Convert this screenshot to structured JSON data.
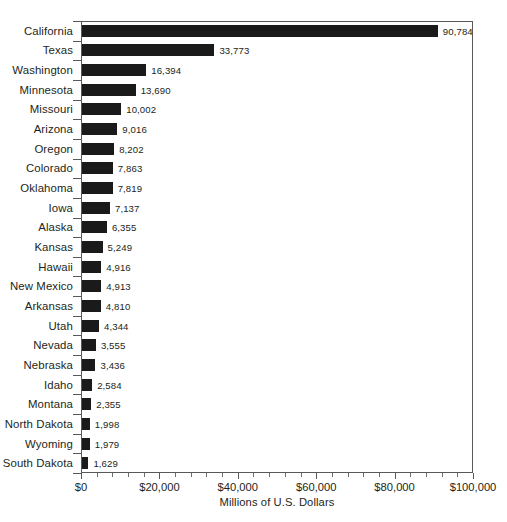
{
  "chart_data": {
    "type": "bar",
    "orientation": "horizontal",
    "title": "",
    "xlabel": "Millions of U.S. Dollars",
    "ylabel": "",
    "xlim": [
      0,
      100000
    ],
    "grid": false,
    "legend": null,
    "xtick_labels": [
      "$0",
      "$20,000",
      "$40,000",
      "$60,000",
      "$80,000",
      "$100,000"
    ],
    "xtick_values": [
      0,
      20000,
      40000,
      60000,
      80000,
      100000
    ],
    "minor_tick_step": 4000,
    "bar_color": "#1a1a1a",
    "axis_color": "#58595b",
    "categories": [
      "California",
      "Texas",
      "Washington",
      "Minnesota",
      "Missouri",
      "Arizona",
      "Oregon",
      "Colorado",
      "Oklahoma",
      "Iowa",
      "Alaska",
      "Kansas",
      "Hawaii",
      "New Mexico",
      "Arkansas",
      "Utah",
      "Nevada",
      "Nebraska",
      "Idaho",
      "Montana",
      "North Dakota",
      "Wyoming",
      "South Dakota"
    ],
    "values": [
      90784,
      33773,
      16394,
      13690,
      10002,
      9016,
      8202,
      7863,
      7819,
      7137,
      6355,
      5249,
      4916,
      4913,
      4810,
      4344,
      3555,
      3436,
      2584,
      2355,
      1998,
      1979,
      1629
    ],
    "value_labels": [
      "90,784",
      "33,773",
      "16,394",
      "13,690",
      "10,002",
      "9,016",
      "8,202",
      "7,863",
      "7,819",
      "7,137",
      "6,355",
      "5,249",
      "4,916",
      "4,913",
      "4,810",
      "4,344",
      "3,555",
      "3,436",
      "2,584",
      "2,355",
      "1,998",
      "1,979",
      "1,629"
    ]
  }
}
